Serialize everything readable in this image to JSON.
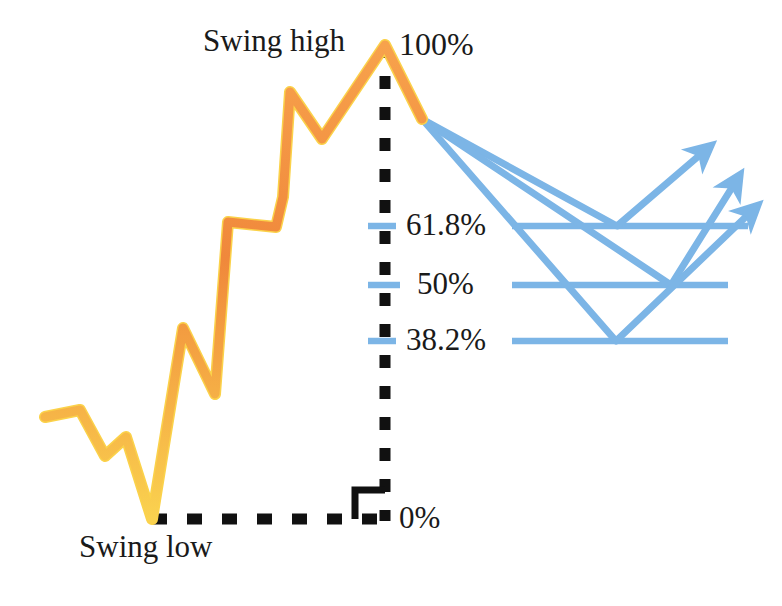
{
  "colors": {
    "price_line": "#F0883B",
    "price_line_highlight": "#FBD24A",
    "fib_line": "#7CB5E6",
    "arrow": "#7CB5E6",
    "measure_line": "#111111",
    "text": "#1a1a1a",
    "background": "#FFFFFF"
  },
  "labels": {
    "swing_high": "Swing high",
    "swing_low": "Swing low",
    "level_100": "100%",
    "level_618": "61.8%",
    "level_50": "50%",
    "level_382": "38.2%",
    "level_0": "0%"
  },
  "chart_data": {
    "type": "line",
    "xlabel": "",
    "ylabel": "",
    "grid": false,
    "legend": "none",
    "xlim": [
      0,
      782
    ],
    "ylim": [
      606,
      0
    ],
    "series": [
      {
        "name": "price-action",
        "color": "#F0883B",
        "points": [
          [
            45,
            417
          ],
          [
            80,
            410
          ],
          [
            105,
            456
          ],
          [
            126,
            437
          ],
          [
            152,
            519
          ],
          [
            183,
            328
          ],
          [
            215,
            394
          ],
          [
            228,
            222
          ],
          [
            276,
            227
          ],
          [
            283,
            197
          ],
          [
            290,
            92
          ],
          [
            322,
            139
          ],
          [
            385,
            45
          ],
          [
            422,
            119
          ]
        ]
      },
      {
        "name": "projection-bounce-618",
        "color": "#7CB5E6",
        "points": [
          [
            422,
            119
          ],
          [
            617,
            226
          ],
          [
            708,
            148
          ]
        ]
      },
      {
        "name": "projection-bounce-50",
        "color": "#7CB5E6",
        "points": [
          [
            422,
            119
          ],
          [
            671,
            285
          ],
          [
            738,
            178
          ]
        ]
      },
      {
        "name": "projection-bounce-382",
        "color": "#7CB5E6",
        "points": [
          [
            422,
            119
          ],
          [
            616,
            341
          ],
          [
            755,
            208
          ]
        ]
      }
    ],
    "fib_levels": [
      {
        "label": "100%",
        "value": 100,
        "y": 45,
        "x_start": 370,
        "x_end": 392,
        "color": "#111111",
        "style": "tick"
      },
      {
        "label": "61.8%",
        "value": 61.8,
        "y": 226,
        "x_start": 370,
        "x_end": 392,
        "color": "#7CB5E6",
        "style": "tick"
      },
      {
        "label": "61.8%",
        "value": 61.8,
        "y": 226,
        "x_start": 512,
        "x_end": 748,
        "color": "#7CB5E6",
        "style": "level"
      },
      {
        "label": "50%",
        "value": 50,
        "y": 285,
        "x_start": 370,
        "x_end": 396,
        "color": "#7CB5E6",
        "style": "tick"
      },
      {
        "label": "50%",
        "value": 50,
        "y": 285,
        "x_start": 512,
        "x_end": 728,
        "color": "#7CB5E6",
        "style": "level"
      },
      {
        "label": "38.2%",
        "value": 38.2,
        "y": 341,
        "x_start": 370,
        "x_end": 392,
        "color": "#7CB5E6",
        "style": "tick"
      },
      {
        "label": "38.2%",
        "value": 38.2,
        "y": 341,
        "x_start": 512,
        "x_end": 728,
        "color": "#7CB5E6",
        "style": "level"
      },
      {
        "label": "0%",
        "value": 0,
        "y": 519,
        "x_start": 152,
        "x_end": 392,
        "color": "#111111",
        "style": "dashed-base"
      }
    ],
    "annotations": [
      {
        "text": "Swing high",
        "x": 203,
        "y": 42,
        "anchor": "left"
      },
      {
        "text": "Swing low",
        "x": 79,
        "y": 548,
        "anchor": "left"
      },
      {
        "text": "100%",
        "x": 399,
        "y": 45,
        "anchor": "left"
      },
      {
        "text": "61.8%",
        "x": 406,
        "y": 226,
        "anchor": "left"
      },
      {
        "text": "50%",
        "x": 417,
        "y": 285,
        "anchor": "left"
      },
      {
        "text": "38.2%",
        "x": 406,
        "y": 341,
        "anchor": "left"
      },
      {
        "text": "0%",
        "x": 399,
        "y": 519,
        "anchor": "left"
      }
    ],
    "measure_axis": {
      "name": "swing-range-measure",
      "vertical_x": 385,
      "top_y": 45,
      "bottom_y": 519,
      "horizontal_y": 519,
      "horizontal_x_start": 152,
      "horizontal_x_end": 392,
      "right_angle_marker": {
        "x": 355,
        "y": 489,
        "size": 30
      }
    }
  }
}
